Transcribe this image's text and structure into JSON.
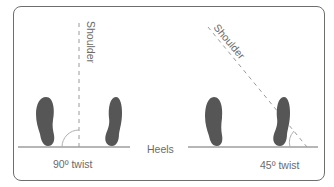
{
  "diagram": {
    "colors": {
      "frame": "#6e6e6e",
      "foot": "#565656",
      "line": "#6e6e6e",
      "dashed": "#9a9a9a",
      "arc": "#b0b0b0",
      "text": "#6b6b6b"
    },
    "labels": {
      "shoulder_left": "Shoulder",
      "shoulder_right": "Shoulder",
      "heels": "Heels",
      "twist_left": "90º twist",
      "twist_right": "45º twist"
    },
    "panels": [
      {
        "name": "left",
        "twist_degrees": 90,
        "shoulder_angle_deg": 90
      },
      {
        "name": "right",
        "twist_degrees": 45,
        "shoulder_angle_deg": 45
      }
    ]
  }
}
